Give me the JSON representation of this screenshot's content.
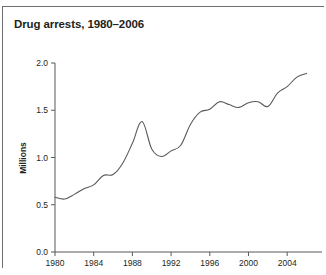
{
  "chart_data": {
    "type": "line",
    "title": "Drug arrests, 1980–2006",
    "xlabel": "",
    "ylabel": "Millions",
    "xlim": [
      1980,
      2007.6
    ],
    "ylim": [
      0.0,
      2.0
    ],
    "grid": false,
    "legend": "none",
    "xticks": [
      "1980",
      "1984",
      "1988",
      "1992",
      "1996",
      "2000",
      "2004"
    ],
    "xtick_values": [
      1980,
      1984,
      1988,
      1992,
      1996,
      2000,
      2004
    ],
    "yticks": [
      "0.0",
      "0.5",
      "1.0",
      "1.5",
      "2.0"
    ],
    "ytick_values": [
      0.0,
      0.5,
      1.0,
      1.5,
      2.0
    ],
    "line_color": "#58595b",
    "series": [
      {
        "name": "Drug arrests",
        "x": [
          1980,
          1981,
          1982,
          1983,
          1984,
          1985,
          1986,
          1987,
          1988,
          1989,
          1990,
          1991,
          1992,
          1993,
          1994,
          1995,
          1996,
          1997,
          1998,
          1999,
          2000,
          2001,
          2002,
          2003,
          2004,
          2005,
          2006
        ],
        "values": [
          0.58,
          0.56,
          0.61,
          0.67,
          0.71,
          0.81,
          0.82,
          0.94,
          1.15,
          1.38,
          1.09,
          1.01,
          1.07,
          1.13,
          1.35,
          1.48,
          1.51,
          1.59,
          1.56,
          1.53,
          1.58,
          1.59,
          1.54,
          1.68,
          1.75,
          1.85,
          1.89
        ]
      }
    ]
  },
  "figure": {
    "frame_color": "#6d6e71",
    "axis_color": "#58595b"
  }
}
